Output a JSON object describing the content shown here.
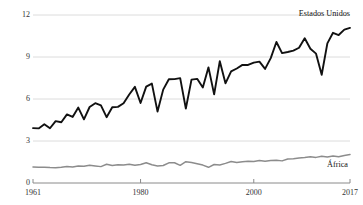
{
  "chart_data": {
    "type": "line",
    "title": "",
    "subtitle": "",
    "xlabel": "",
    "ylabel": "Milhares de kg/ha de milho",
    "xlim": [
      1961,
      2017
    ],
    "ylim": [
      0,
      12
    ],
    "grid": true,
    "gridlines_y": [
      3,
      6,
      9,
      12
    ],
    "yticks": [
      "0",
      "3",
      "6",
      "9",
      "12"
    ],
    "ytick_values": [
      0,
      3,
      6,
      9,
      12
    ],
    "xticks": [
      "1961",
      "1980",
      "2000",
      "2017"
    ],
    "xtick_values": [
      1961,
      1980,
      2000,
      2017
    ],
    "legend_position": "inline-right",
    "colors": {
      "estados_unidos": "#111111",
      "africa": "#8c8c8c",
      "grid": "#d8d8d8",
      "axis": "#8a8a8a",
      "text": "#1a1a1a"
    },
    "x": [
      1961,
      1962,
      1963,
      1964,
      1965,
      1966,
      1967,
      1968,
      1969,
      1970,
      1971,
      1972,
      1973,
      1974,
      1975,
      1976,
      1977,
      1978,
      1979,
      1980,
      1981,
      1982,
      1983,
      1984,
      1985,
      1986,
      1987,
      1988,
      1989,
      1990,
      1991,
      1992,
      1993,
      1994,
      1995,
      1996,
      1997,
      1998,
      1999,
      2000,
      2001,
      2002,
      2003,
      2004,
      2005,
      2006,
      2007,
      2008,
      2009,
      2010,
      2011,
      2012,
      2013,
      2014,
      2015,
      2016,
      2017
    ],
    "series": [
      {
        "name": "Estados Unidos",
        "label": "Estados Unidos",
        "color": "#111111",
        "values": [
          3.92,
          3.9,
          4.2,
          3.91,
          4.42,
          4.34,
          4.9,
          4.72,
          5.39,
          4.55,
          5.43,
          5.7,
          5.54,
          4.7,
          5.41,
          5.44,
          5.7,
          6.32,
          6.87,
          5.71,
          6.88,
          7.1,
          5.1,
          6.67,
          7.41,
          7.42,
          7.49,
          5.31,
          7.38,
          7.44,
          6.82,
          8.26,
          6.33,
          8.7,
          7.12,
          7.97,
          8.18,
          8.44,
          8.43,
          8.6,
          8.67,
          8.15,
          8.92,
          10.07,
          9.28,
          9.36,
          9.46,
          9.66,
          10.34,
          9.59,
          9.24,
          7.73,
          9.97,
          10.73,
          10.57,
          10.96,
          11.08
        ]
      },
      {
        "name": "África",
        "label": "África",
        "color": "#8c8c8c",
        "values": [
          1.14,
          1.12,
          1.12,
          1.1,
          1.09,
          1.13,
          1.18,
          1.14,
          1.21,
          1.19,
          1.27,
          1.22,
          1.17,
          1.34,
          1.25,
          1.3,
          1.29,
          1.34,
          1.26,
          1.32,
          1.45,
          1.3,
          1.22,
          1.25,
          1.44,
          1.45,
          1.26,
          1.52,
          1.47,
          1.38,
          1.28,
          1.12,
          1.32,
          1.29,
          1.4,
          1.54,
          1.46,
          1.51,
          1.55,
          1.53,
          1.6,
          1.55,
          1.6,
          1.63,
          1.58,
          1.72,
          1.74,
          1.79,
          1.82,
          1.87,
          1.83,
          1.91,
          1.86,
          1.93,
          1.88,
          1.97,
          2.03
        ]
      }
    ]
  }
}
